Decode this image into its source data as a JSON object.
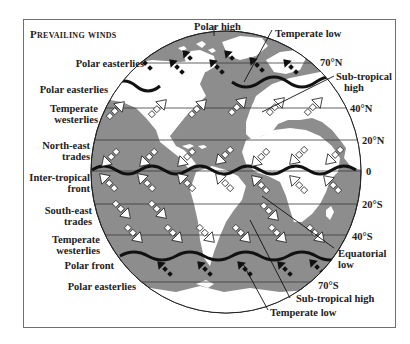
{
  "title": "Prevailing winds",
  "colors": {
    "ocean": "#8d8d8d",
    "land": "#ffffff",
    "front_line": "#111111",
    "lat_line": "#3a3a3a",
    "arrow_dark": "#111111",
    "arrow_light": "#ffffff",
    "frame": "#6f6f6f"
  },
  "left_labels": [
    {
      "id": "polar-easterlies-n1",
      "text": "Polar easterlies"
    },
    {
      "id": "polar-easterlies-n2",
      "text": "Polar easterlies"
    },
    {
      "id": "temperate-westerlies-n",
      "line1": "Temperate",
      "line2": "westerlies"
    },
    {
      "id": "northeast-trades",
      "line1": "North-east",
      "line2": "trades"
    },
    {
      "id": "intertropical-front",
      "line1": "Inter-tropical",
      "line2": "front"
    },
    {
      "id": "southeast-trades",
      "line1": "South-east",
      "line2": "trades"
    },
    {
      "id": "temperate-westerlies-s",
      "line1": "Temperate",
      "line2": "westerlies"
    },
    {
      "id": "polar-front",
      "text": "Polar front"
    },
    {
      "id": "polar-easterlies-s",
      "text": "Polar easterlies"
    }
  ],
  "right_labels": {
    "polar_high": "Polar high",
    "temperate_low_n": "Temperate low",
    "subtropical_high_n_line1": "Sub-tropical",
    "subtropical_high_n_line2": "high",
    "equatorial_low_line1": "Equatorial",
    "equatorial_low_line2": "low",
    "subtropical_high_s": "Sub-tropical high",
    "temperate_low_s": "Temperate low"
  },
  "latitudes": [
    {
      "label": "70°N",
      "y": 63
    },
    {
      "label": "40°N",
      "y": 108
    },
    {
      "label": "20°N",
      "y": 140
    },
    {
      "label": "0",
      "y": 171
    },
    {
      "label": "20°S",
      "y": 204
    },
    {
      "label": "40°S",
      "y": 235
    },
    {
      "label": "70°S",
      "y": 282
    }
  ]
}
